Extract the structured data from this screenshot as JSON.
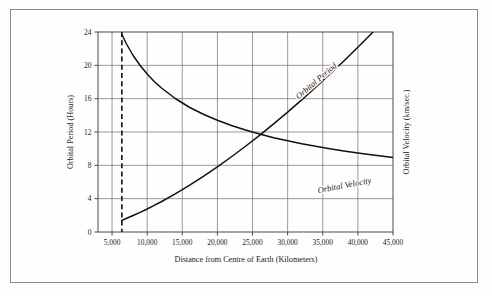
{
  "figure": {
    "background_color": "#fdfdfc",
    "frame_color": "#8a8a8a",
    "curve_color": "#111111",
    "grid_color": "#6f6f6f"
  },
  "chart_data": {
    "type": "line",
    "title": "",
    "xlabel": "Distance from Centre of Earth  (Kilometers)",
    "ylabel": "Orbital Period (Hours)",
    "y2label": "Orbital Velocity (km/sec.)",
    "xlim": [
      3000,
      45000
    ],
    "ylim": [
      0,
      24
    ],
    "xticks": [
      5000,
      10000,
      15000,
      20000,
      25000,
      30000,
      35000,
      40000,
      45000
    ],
    "xticklabels": [
      "5,000",
      "10,000",
      "15,000",
      "20,000",
      "25,000",
      "30,000",
      "35,000",
      "40,000",
      "45,000"
    ],
    "yticks": [
      0,
      4,
      8,
      12,
      16,
      20,
      24
    ],
    "yticklabels": [
      "0",
      "4",
      "8",
      "12",
      "16",
      "20",
      "24"
    ],
    "y2ticks": [],
    "y2ticklabels": [],
    "grid": true,
    "legend_position": "inline-curve-labels",
    "annotations": [
      {
        "name": "earth-surface-marker",
        "type": "vertical-dashed-line",
        "x": 6400,
        "label": ""
      }
    ],
    "series": [
      {
        "name": "Orbital Period",
        "label_text": "Orbital Period",
        "axis": "left",
        "units": "hours",
        "x": [
          6400,
          7000,
          8000,
          9000,
          10000,
          11000,
          12000,
          14000,
          16000,
          18000,
          20000,
          22000,
          24000,
          26000,
          28000,
          30000,
          32000,
          34000,
          36000,
          38000,
          40000,
          42164,
          43000,
          45000
        ],
        "values": [
          1.4,
          1.62,
          1.98,
          2.36,
          2.76,
          3.19,
          3.63,
          4.58,
          5.6,
          6.68,
          7.82,
          9.03,
          10.29,
          11.6,
          12.97,
          14.39,
          15.85,
          17.37,
          18.93,
          20.53,
          22.18,
          24.0,
          24.95,
          26.72
        ]
      },
      {
        "name": "Orbital Velocity",
        "label_text": "Orbital Velocity",
        "axis": "right",
        "units": "km/sec.",
        "x": [
          6400,
          7000,
          8000,
          9000,
          10000,
          11000,
          12000,
          14000,
          16000,
          18000,
          20000,
          22000,
          24000,
          26000,
          28000,
          30000,
          32000,
          34000,
          36000,
          38000,
          40000,
          42164,
          45000
        ],
        "values": [
          7.9,
          7.55,
          7.06,
          6.66,
          6.32,
          6.02,
          5.77,
          5.34,
          4.99,
          4.71,
          4.47,
          4.26,
          4.08,
          3.92,
          3.77,
          3.65,
          3.53,
          3.43,
          3.33,
          3.24,
          3.16,
          3.08,
          2.98
        ]
      }
    ]
  }
}
